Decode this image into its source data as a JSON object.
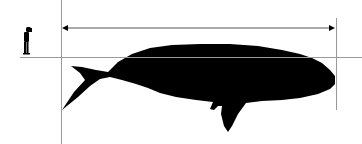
{
  "diagram": {
    "type": "size-comparison",
    "subjects": [
      {
        "name": "human",
        "icon": "human-silhouette-icon"
      },
      {
        "name": "whale",
        "icon": "whale-silhouette-icon"
      }
    ],
    "measurement": {
      "kind": "length",
      "arrow": "double-headed",
      "label": ""
    },
    "colors": {
      "background": "#ffffff",
      "silhouette": "#000000",
      "guide_lines": "#9a9a9a",
      "arrow": "#555555"
    }
  }
}
